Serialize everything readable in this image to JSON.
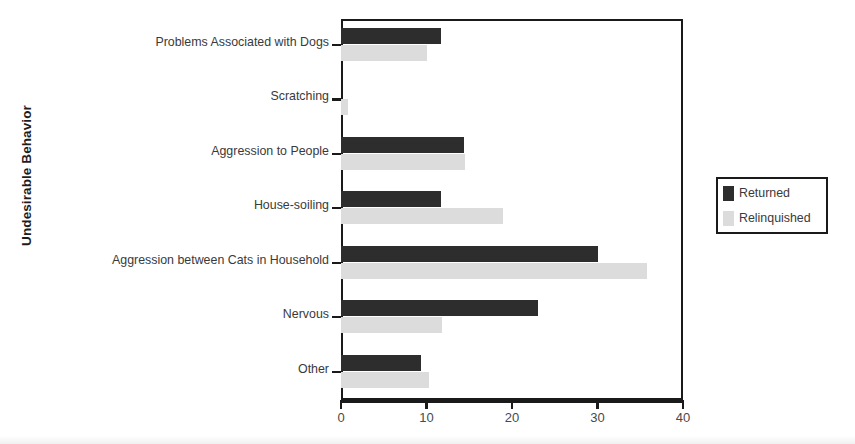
{
  "chart_data": {
    "type": "bar",
    "orientation": "horizontal",
    "title": "",
    "xlabel": "",
    "ylabel": "Undesirable Behavior",
    "xlim": [
      0,
      40
    ],
    "xticks": [
      0,
      10,
      20,
      30,
      40
    ],
    "xtick_labels": [
      "0",
      "10",
      "20",
      "30",
      "40"
    ],
    "grid": false,
    "legend_position": "right",
    "categories": [
      "Problems Associated with Dogs",
      "Scratching",
      "Aggression to People",
      "House-soiling",
      "Aggression between Cats in Household",
      "Nervous",
      "Other"
    ],
    "series": [
      {
        "name": "Returned",
        "color": "#2d2d2d",
        "values": [
          11.7,
          0,
          14.4,
          11.7,
          30.0,
          23.0,
          9.3
        ]
      },
      {
        "name": "Relinquished",
        "color": "#dcdcdc",
        "values": [
          10.0,
          0.8,
          14.5,
          19.0,
          35.8,
          11.8,
          10.3
        ]
      }
    ]
  },
  "axes": {
    "y_title": "Undesirable Behavior"
  },
  "legend": {
    "entries": [
      {
        "label": "Returned",
        "color": "#2d2d2d"
      },
      {
        "label": "Relinquished",
        "color": "#dcdcdc"
      }
    ]
  }
}
